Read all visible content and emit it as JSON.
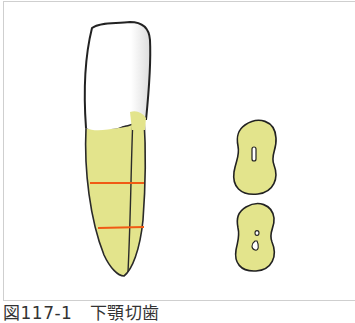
{
  "figure": {
    "caption": "図117-1　下顎切歯",
    "colors": {
      "root_fill": "#e3e48c",
      "crown_fill": "#ffffff",
      "outline": "#222222",
      "section_lines": "#f05a14",
      "frame_border": "#cfcfcf"
    },
    "elements": {
      "tooth": "Mandibular incisor, labial/lateral view with crown (white) and root (yellow)",
      "section_lines_count": 2,
      "cross_sections": [
        {
          "label": "upper cross-section",
          "canal": "single elongated canal"
        },
        {
          "label": "lower cross-section",
          "canal": "split canal (two openings)"
        }
      ]
    }
  }
}
